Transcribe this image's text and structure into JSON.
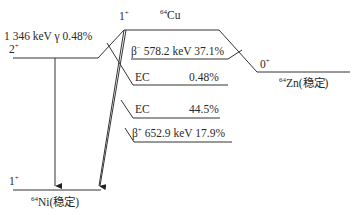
{
  "diagram": {
    "type": "nuclear-decay-scheme",
    "parent": {
      "nuclide": "Cu",
      "mass_number": "64",
      "spin_parity": "1",
      "parity_sign": "+"
    },
    "daughter_zn": {
      "nuclide": "Zn(稳定)",
      "mass_number": "64",
      "spin_parity": "0",
      "parity_sign": "+"
    },
    "daughter_ni": {
      "nuclide": "Ni(稳定)",
      "mass_number": "64",
      "ground_spin_parity": "1",
      "ground_parity_sign": "+",
      "excited_spin_parity": "2",
      "excited_parity_sign": "+"
    },
    "gamma": {
      "label": "1 346 keV γ 0.48%"
    },
    "branches": [
      {
        "id": "beta-minus",
        "symbol": "β",
        "sign": "−",
        "text": " 578.2 keV 37.1%"
      },
      {
        "id": "ec-1",
        "label": "EC",
        "value": "0.48%"
      },
      {
        "id": "ec-2",
        "label": "EC",
        "value": "44.5%"
      },
      {
        "id": "beta-plus",
        "symbol": "β",
        "sign": "+",
        "text": " 652.9 keV 17.9%"
      }
    ]
  }
}
